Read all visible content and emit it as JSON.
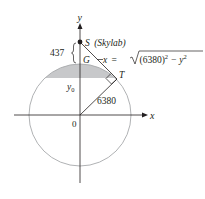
{
  "diagram": {
    "axes": {
      "x_label": "x",
      "y_label": "y",
      "origin_label": "0"
    },
    "points": {
      "S": {
        "label": "S",
        "note": "(Skylab)"
      },
      "G": {
        "label": "G"
      },
      "T": {
        "label": "T"
      }
    },
    "altitude_label": "437",
    "radius_label": "6380",
    "y0_label": "y",
    "y0_sub": "0",
    "equation": {
      "lhs": "x",
      "eq": "=",
      "radicand": "(6380)",
      "sq": "2",
      "minus": " − y",
      "sq2": "2"
    },
    "colors": {
      "stroke": "#231f20",
      "circle": "#a7a9ac",
      "shade": "#c7c8ca"
    }
  }
}
